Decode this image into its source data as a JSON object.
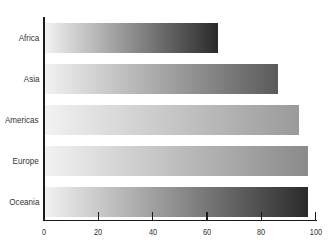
{
  "chart_data": {
    "type": "bar",
    "orientation": "horizontal",
    "title": "",
    "xlabel": "",
    "ylabel": "",
    "categories": [
      "Africa",
      "Asia",
      "Americas",
      "Europe",
      "Oceania"
    ],
    "values": [
      64,
      86,
      94,
      97,
      97
    ],
    "xlim": [
      0,
      100
    ],
    "xticks": [
      "0",
      "20",
      "40",
      "60",
      "80",
      "100"
    ],
    "grid": false,
    "legend": null,
    "bar_style": "horizontal gradient from light gray to darker shade",
    "bar_end_colors": [
      "#2a2a2a",
      "#5a5a5a",
      "#9a9a9a",
      "#8a8a8a",
      "#2a2a2a"
    ],
    "bar_start_color": "#f2f2f2"
  }
}
